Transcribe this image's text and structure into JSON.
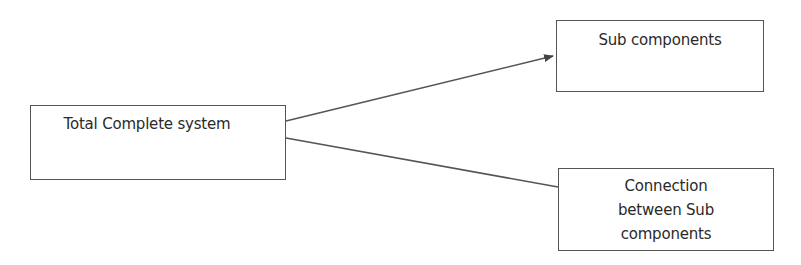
{
  "diagram": {
    "nodes": [
      {
        "id": "total",
        "label": "Total Complete system"
      },
      {
        "id": "sub",
        "label": "Sub components"
      },
      {
        "id": "conn",
        "label_lines": [
          "Connection",
          "between Sub",
          "components"
        ]
      }
    ],
    "edges": [
      {
        "from": "total",
        "to": "sub",
        "arrowhead": true
      },
      {
        "from": "total",
        "to": "conn",
        "arrowhead": false
      }
    ],
    "colors": {
      "stroke": "#555555",
      "text": "#2a2a2a",
      "background": "#ffffff"
    }
  }
}
